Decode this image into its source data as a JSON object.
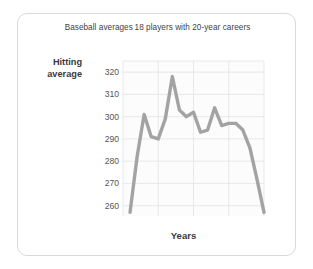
{
  "figure": {
    "title": "Baseball averages 18 players with 20-year careers",
    "y_axis_title_line1": "Hitting",
    "y_axis_title_line2": "average",
    "x_axis_title": "Years",
    "line_color": "#a3a3a3",
    "grid_color": "#e3e3e3",
    "card_border_color": "#d9d9d9",
    "plot_background": "#fcfcfc"
  },
  "chart_data": {
    "type": "line",
    "title": "Baseball averages 18 players with 20-year careers",
    "xlabel": "Years",
    "ylabel": "Hitting average",
    "xlim": [
      0,
      20
    ],
    "ylim": [
      250,
      325
    ],
    "xticks": [
      0,
      5,
      10,
      15,
      20
    ],
    "xtick_labels": [
      "0",
      "5",
      "10",
      "15",
      "20"
    ],
    "yticks": [
      250,
      260,
      270,
      280,
      290,
      300,
      310,
      320
    ],
    "ytick_labels": [
      "250",
      "260",
      "270",
      "280",
      "290",
      "300",
      "310",
      "320"
    ],
    "grid": true,
    "legend": "none",
    "x": [
      1,
      2,
      3,
      4,
      5,
      6,
      7,
      8,
      9,
      10,
      11,
      12,
      13,
      14,
      15,
      16,
      17,
      18,
      19,
      20
    ],
    "values": [
      257,
      282,
      301,
      291,
      290,
      299,
      318,
      303,
      300,
      302,
      293,
      294,
      304,
      296,
      297,
      297,
      294,
      286,
      272,
      257
    ],
    "series": [
      {
        "name": "Hitting average",
        "values": [
          257,
          282,
          301,
          291,
          290,
          299,
          318,
          303,
          300,
          302,
          293,
          294,
          304,
          296,
          297,
          297,
          294,
          286,
          272,
          257
        ]
      }
    ]
  }
}
